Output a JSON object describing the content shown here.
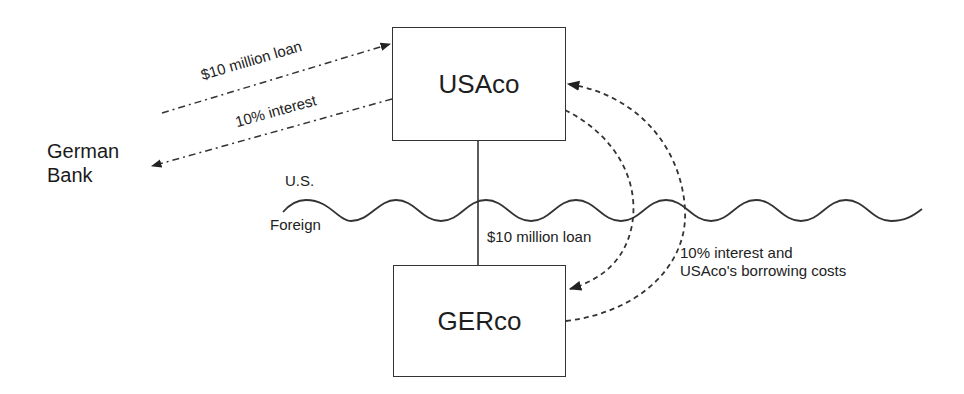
{
  "diagram": {
    "entities": {
      "usaco": {
        "label": "USAco"
      },
      "gerco": {
        "label": "GERco"
      },
      "german_bank": {
        "line1": "German",
        "line2": "Bank"
      }
    },
    "regions": {
      "upper": "U.S.",
      "lower": "Foreign"
    },
    "flows": {
      "bank_loan": {
        "label": "$10 million loan",
        "from": "German Bank",
        "to": "USAco",
        "style": "dash-dot"
      },
      "bank_interest": {
        "label": "10% interest",
        "from": "USAco",
        "to": "German Bank",
        "style": "dash-dot"
      },
      "intercompany_loan": {
        "label": "$10 million loan",
        "from": "USAco",
        "to": "GERco",
        "style": "dashed"
      },
      "intercompany_interest": {
        "line1": "10% interest and",
        "line2": "USAco's borrowing costs",
        "from": "GERco",
        "to": "USAco",
        "style": "dashed"
      }
    },
    "colors": {
      "line": "#333333",
      "text": "#1a1a1a",
      "background": "#ffffff"
    }
  }
}
